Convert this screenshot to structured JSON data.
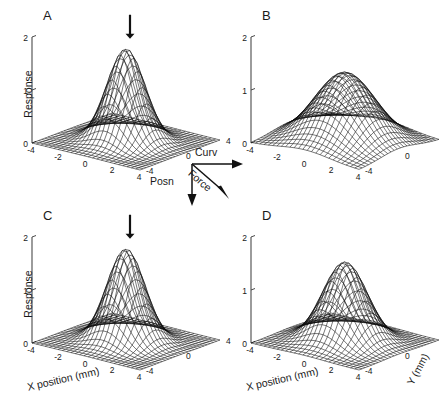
{
  "figure": {
    "background": "#ffffff",
    "mesh_color": "#0a0a0a",
    "axis_color": "#4a4a4a",
    "panel_letters": [
      "A",
      "B",
      "C",
      "D"
    ]
  },
  "legend": {
    "curv_label": "Curv",
    "posn_label": "Posn",
    "force_label": "Force"
  },
  "labels": {
    "response": "Response",
    "x_position": "X position (mm)",
    "y_mm": "Y (mm)"
  },
  "ticks": {
    "z": [
      "0",
      "1",
      "2"
    ],
    "x": [
      "-4",
      "-2",
      "0",
      "2",
      "4"
    ],
    "y": [
      "4",
      "0",
      "-4"
    ]
  },
  "chart_data": {
    "type": "surface",
    "title": "",
    "xlabel": "X position (mm)",
    "ylabel": "Y (mm)",
    "zlabel": "Response",
    "xlim": [
      -4,
      4
    ],
    "ylim": [
      -4,
      4
    ],
    "zlim": [
      0,
      2
    ],
    "xticks": [
      -4,
      -2,
      0,
      2,
      4
    ],
    "yticks": [
      4,
      0,
      -4
    ],
    "zticks": [
      0,
      1,
      2
    ],
    "grid": false,
    "legend_position": "center",
    "annotations": [
      {
        "text": "Curv",
        "type": "vector-arrow",
        "direction": "right"
      },
      {
        "text": "Posn",
        "type": "vector-arrow",
        "direction": "down"
      },
      {
        "text": "Force",
        "type": "vector-arrow",
        "direction": "down-right"
      }
    ],
    "panels": [
      {
        "label": "A",
        "peak_response": 1.75,
        "peak_x": 0.0,
        "peak_y": 0.0,
        "sigma_x": 1.15,
        "sigma_y": 1.15,
        "has_marker_arrow": true,
        "show_response_label": true,
        "show_x_label": false,
        "show_y_label": false
      },
      {
        "label": "B",
        "peak_response": 1.3,
        "peak_x": 0.0,
        "peak_y": 0.0,
        "sigma_x": 1.85,
        "sigma_y": 1.85,
        "has_marker_arrow": false,
        "show_response_label": false,
        "show_x_label": false,
        "show_y_label": false
      },
      {
        "label": "C",
        "peak_response": 1.75,
        "peak_x": 0.0,
        "peak_y": 0.0,
        "sigma_x": 1.15,
        "sigma_y": 1.15,
        "has_marker_arrow": true,
        "show_response_label": true,
        "show_x_label": true,
        "show_y_label": false
      },
      {
        "label": "D",
        "peak_response": 1.5,
        "peak_x": 0.0,
        "peak_y": 0.0,
        "sigma_x": 1.35,
        "sigma_y": 1.35,
        "has_marker_arrow": false,
        "show_response_label": false,
        "show_x_label": true,
        "show_y_label": true
      }
    ]
  }
}
